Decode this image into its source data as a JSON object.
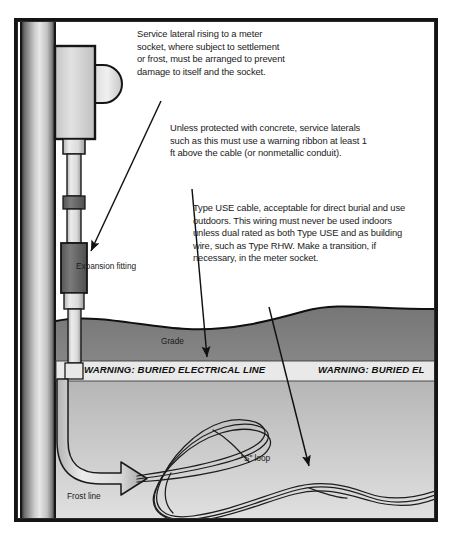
{
  "figure": {
    "colors": {
      "ink": "#1b1b1b",
      "frame": "#141414",
      "topsoil": "#7a7a7a",
      "subsoil_top": "#9d9d9d",
      "subsoil_bottom": "#d8d8d8",
      "ribbon": "#e9e9e9",
      "conduit": "#dcdcdc",
      "fitting_dark": "#6a6a6a",
      "meter_body": "#d2d2d2"
    }
  },
  "callouts": [
    {
      "id": "callout-1",
      "text": "Service lateral rising to a meter socket, where subject to settlement or frost, must be arranged to prevent damage to itself and the socket.",
      "points_to": "expansion-fitting"
    },
    {
      "id": "callout-2",
      "text": "Unless protected with concrete, service laterals such as this must use a warning ribbon at least 1 ft above the cable (or nonmetallic conduit).",
      "points_to": "warning-ribbon"
    },
    {
      "id": "callout-3",
      "text": "Type USE cable, acceptable for direct burial and use outdoors. This wiring must never be used indoors unless dual rated as both Type USE and as building wire, such as Type RHW. Make a transition, if necessary, in the meter socket.",
      "points_to": "use-cable"
    }
  ],
  "labels": {
    "expansion_fitting": "Expansion fitting",
    "grade": "Grade",
    "s_loop": "\"S\" loop",
    "frost_line": "Frost line"
  },
  "ribbon": {
    "text_1": "WARNING: BURIED ELECTRICAL LINE",
    "text_2": "WARNING: BURIED EL"
  }
}
